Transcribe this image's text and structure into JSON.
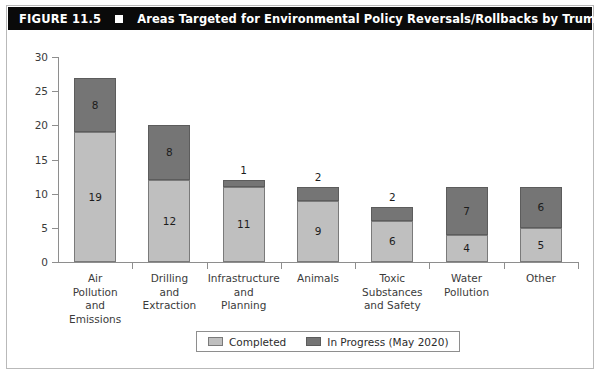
{
  "header": {
    "figure_number": "FIGURE 11.5",
    "bullet": "square-bullet",
    "title": "Areas Targeted for Environmental Policy Reversals/Rollbacks by Trump Administration"
  },
  "chart_data": {
    "type": "bar",
    "stacked": true,
    "title": "Areas Targeted for Environmental Policy Reversals/Rollbacks by Trump Administration",
    "xlabel": "",
    "ylabel": "",
    "ylim": [
      0,
      30
    ],
    "yticks": [
      0,
      5,
      10,
      15,
      20,
      25,
      30
    ],
    "grid": false,
    "legend_position": "bottom",
    "categories": [
      "Air\nPollution\nand\nEmissions",
      "Drilling\nand\nExtraction",
      "Infrastructure\nand\nPlanning",
      "Animals",
      "Toxic\nSubstances\nand Safety",
      "Water\nPollution",
      "Other"
    ],
    "series": [
      {
        "name": "Completed",
        "color": "#bfbfbf",
        "values": [
          19,
          12,
          11,
          9,
          6,
          4,
          5
        ]
      },
      {
        "name": "In Progress (May 2020)",
        "color": "#757575",
        "values": [
          8,
          8,
          1,
          2,
          2,
          7,
          6
        ]
      }
    ],
    "totals": [
      27,
      20,
      12,
      11,
      8,
      11,
      11
    ]
  },
  "legend": {
    "items": [
      {
        "label": "Completed",
        "swatch": "completed"
      },
      {
        "label": "In Progress (May 2020)",
        "swatch": "inprogress"
      }
    ]
  },
  "colors": {
    "completed": "#bfbfbf",
    "in_progress": "#757575",
    "title_bar": "#0a0a0a",
    "axis": "#8e8e8e",
    "text": "#3b3b3b"
  }
}
